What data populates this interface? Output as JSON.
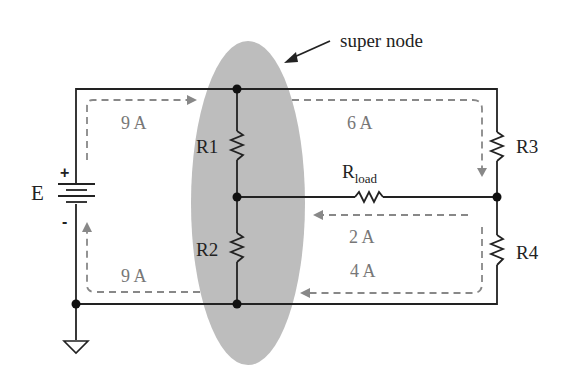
{
  "diagram": {
    "title": "super node",
    "source": {
      "label": "E",
      "plus": "+",
      "minus": "-"
    },
    "resistors": {
      "r1": "R1",
      "r2": "R2",
      "r3": "R3",
      "r4": "R4",
      "rload_main": "R",
      "rload_sub": "load"
    },
    "currents": {
      "top_left": "9 A",
      "bottom_left": "9 A",
      "top_right": "6 A",
      "mid_right": "2 A",
      "bottom_right": "4 A"
    },
    "colors": {
      "wire": "#222222",
      "supernode_fill": "#b8b8b8",
      "current_arrow": "#888888"
    }
  }
}
